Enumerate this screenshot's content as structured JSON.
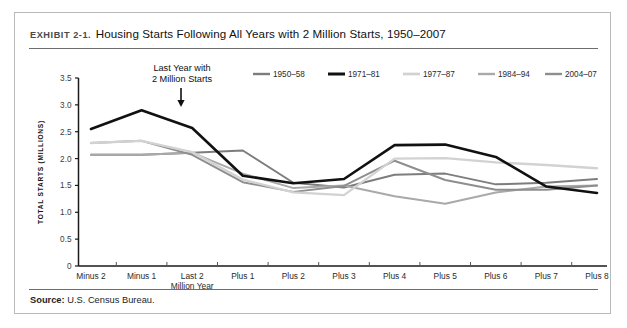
{
  "exhibit": {
    "label": "EXHIBIT 2-1.",
    "title": "Housing Starts Following All Years with 2 Million Starts, 1950–2007"
  },
  "source": {
    "prefix": "Source:",
    "text": "U.S. Census Bureau."
  },
  "annotation": {
    "line1": "Last Year with",
    "line2": "2 Million Starts",
    "arrow": "down-arrow",
    "target_category": "Last 2 Million Year"
  },
  "colors": {
    "series_1950_58": "#7d7d7d",
    "series_1971_81": "#111111",
    "series_1977_87": "#d2d2d2",
    "series_1984_94": "#a9a9a9",
    "series_2004_07": "#8e8e8e",
    "axis": "#1a1a1a",
    "frame": "#b9b9b9",
    "rule": "#6d6d6d"
  },
  "chart_data": {
    "type": "line",
    "title": "Housing Starts Following All Years with 2 Million Starts, 1950–2007",
    "xlabel": "YEARS RELATIVE TO PRECEDING YEAR WITH 2 MILLION STARTS",
    "ylabel": "TOTAL STARTS (MILLIONS)",
    "ylim": [
      0,
      3.5
    ],
    "yticks": [
      0,
      0.5,
      1.0,
      1.5,
      2.0,
      2.5,
      3.0,
      3.5
    ],
    "ytick_labels": [
      "0",
      "0.5",
      "1.0",
      "1.5",
      "2.0",
      "2.5",
      "3.0",
      "3.5"
    ],
    "grid": false,
    "legend_position": "top-center",
    "categories": [
      "Minus 2",
      "Minus 1",
      "Last 2 Million Year",
      "Plus 1",
      "Plus 2",
      "Plus 3",
      "Plus 4",
      "Plus 5",
      "Plus 6",
      "Plus 7",
      "Plus 8"
    ],
    "category_labels": [
      [
        "Minus 2"
      ],
      [
        "Minus 1"
      ],
      [
        "Last 2",
        "Million Year"
      ],
      [
        "Plus 1"
      ],
      [
        "Plus 2"
      ],
      [
        "Plus 3"
      ],
      [
        "Plus 4"
      ],
      [
        "Plus 5"
      ],
      [
        "Plus 6"
      ],
      [
        "Plus 7"
      ],
      [
        "Plus 8"
      ]
    ],
    "series": [
      {
        "name": "1950–58",
        "color": "#7d7d7d",
        "width": 2.0,
        "values": [
          2.07,
          2.07,
          2.11,
          2.15,
          1.55,
          1.46,
          1.7,
          1.72,
          1.52,
          1.55,
          1.62
        ]
      },
      {
        "name": "1971–81",
        "color": "#111111",
        "width": 2.6,
        "values": [
          2.55,
          2.9,
          2.57,
          1.68,
          1.54,
          1.62,
          2.25,
          2.26,
          2.03,
          1.48,
          1.36
        ]
      },
      {
        "name": "1977–87",
        "color": "#d2d2d2",
        "width": 2.3,
        "values": [
          2.29,
          2.33,
          2.12,
          1.61,
          1.37,
          1.32,
          2.0,
          2.01,
          1.93,
          1.88,
          1.82
        ]
      },
      {
        "name": "1984–94",
        "color": "#a9a9a9",
        "width": 2.0,
        "values": [
          2.07,
          2.07,
          2.11,
          1.72,
          1.45,
          1.5,
          1.3,
          1.16,
          1.37,
          1.48,
          1.5
        ]
      },
      {
        "name": "2004–07",
        "color": "#8e8e8e",
        "width": 2.0,
        "values": [
          2.29,
          2.33,
          2.07,
          1.56,
          1.38,
          1.49,
          1.96,
          1.6,
          1.42,
          1.42,
          1.5
        ]
      }
    ]
  }
}
